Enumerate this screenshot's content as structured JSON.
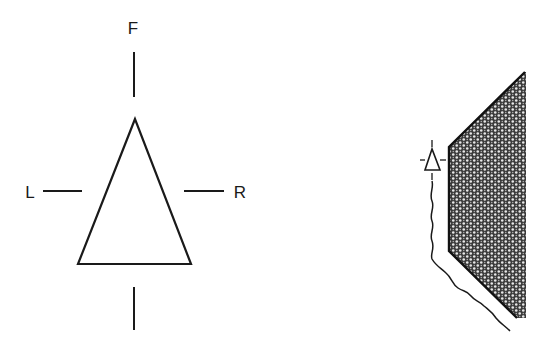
{
  "figure": {
    "left_diagram": {
      "description": "Sensor orientation symbol with direction labels",
      "labels": {
        "front": "F",
        "left": "L",
        "right": "R"
      }
    },
    "right_diagram": {
      "description": "Sensor placed beside a hatched wall/obstacle region with a wavy boundary line"
    },
    "colors": {
      "stroke": "#1a1a1a",
      "background": "#ffffff"
    }
  }
}
